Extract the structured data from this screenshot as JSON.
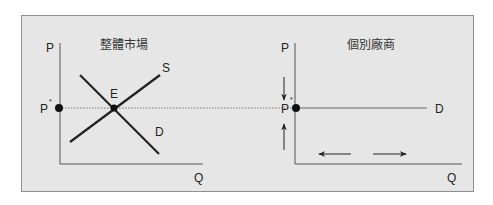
{
  "left_panel": {
    "title": "整體市場",
    "y_axis_label": "P",
    "x_axis_label": "Q",
    "price_label": "P",
    "price_superscript": "*",
    "equilibrium_label": "E",
    "supply_label": "S",
    "demand_label": "D"
  },
  "right_panel": {
    "title": "個別廠商",
    "y_axis_label": "P",
    "x_axis_label": "Q",
    "price_label": "P",
    "price_superscript": "*",
    "demand_label": "D"
  },
  "colors": {
    "background": "#e6e6e6",
    "frame_border": "#8f8f8f",
    "axis": "#555555",
    "curve": "#222222",
    "dotted": "#777777"
  }
}
